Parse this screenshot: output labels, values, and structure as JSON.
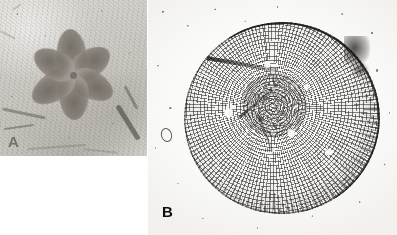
{
  "figure": {
    "kind": "two-panel fossil micrograph plate",
    "background_color": "#ffffff",
    "width_px": 397,
    "height_px": 235
  },
  "panels": [
    {
      "id": "A",
      "label": "A",
      "label_visible": true,
      "name": "fossil-rosette-impression",
      "description": "Six-lobed rosette-shaped fossil impression preserved in fine-grained pale grey rock matrix",
      "position": {
        "left": 0,
        "top": 0,
        "width": 147,
        "height": 156
      },
      "colors": {
        "matrix": "#cfcdc8",
        "petal": "#6e6860",
        "highlight": "#dcdad4"
      },
      "features": {
        "petal_count": 6,
        "center_hub": "small dark circular point",
        "matrix_streaks": 8
      }
    },
    {
      "id": "B",
      "label": "B",
      "label_visible": true,
      "name": "fossil-disc-thin-section",
      "description": "Transmitted-light thin-section micrograph of a circular fossil disc showing radial and concentric grid microstructure on a pale slide with scattered dark debris",
      "position": {
        "left": 148,
        "top": 0,
        "width": 249,
        "height": 235
      },
      "colors": {
        "slide": "#fbfbfa",
        "grid_lines": "#262420",
        "rim": "#1c1a17"
      },
      "features": {
        "disc_center": {
          "x": 134,
          "y": 118
        },
        "disc_radius_px": 96,
        "structure": "radial septa crossed by concentric growth rings",
        "radial_cleft_count": 3,
        "pale_lacunae": 5,
        "bubble_outline": true,
        "dark_blotch": true
      }
    }
  ],
  "labels": {
    "panel_a": "A",
    "panel_b": "B"
  }
}
